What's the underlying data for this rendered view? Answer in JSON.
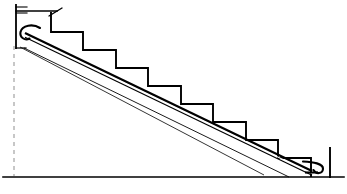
{
  "document": {
    "type": "technical-line-drawing",
    "title": "Staircase side elevation with inclined rail",
    "view": "side-elevation",
    "canvas": {
      "width": 347,
      "height": 194
    },
    "background_color": "#ffffff",
    "line_color": "#000000",
    "dashed_guide_color": "#b0b0b0"
  },
  "geometry": {
    "ground_line": {
      "label": "ground-line",
      "x1": 3,
      "y1": 177,
      "x2": 344,
      "y2": 177,
      "stroke_width": 1.6
    },
    "wall_line": {
      "label": "upper-floor-wall-edge",
      "x1": 16,
      "y1": 5,
      "x2": 16,
      "y2": 48,
      "stroke_width": 1.8
    },
    "wall_ticks": [
      {
        "label": "wall-tick-top",
        "x1": 16,
        "y1": 7,
        "x2": 27,
        "y2": 7
      },
      {
        "label": "wall-tick-lower",
        "x1": 16,
        "y1": 13,
        "x2": 27,
        "y2": 13
      }
    ],
    "top_floor_line": {
      "label": "top-landing-floor",
      "x1": 16,
      "y1": 11,
      "x2": 57,
      "y2": 11,
      "stroke_width": 1.6
    },
    "newel_marker": {
      "label": "top-newel-post-slash",
      "x1": 49,
      "y1": 16,
      "x2": 62,
      "y2": 8,
      "stroke_width": 1.4
    },
    "newel_drop": {
      "label": "top-newel-drop",
      "x1": 51,
      "y1": 13,
      "x2": 51,
      "y2": 32,
      "stroke_width": 1.8
    },
    "dashed_plumb_line": {
      "label": "plumb-reference-dashed",
      "x1": 14,
      "y1": 46,
      "x2": 14,
      "y2": 176,
      "dash": "4 4",
      "stroke_width": 1.4
    },
    "step_profile": {
      "label": "stair-nosing-profile",
      "description": "8 treads and risers descending left to right",
      "start": {
        "x": 51,
        "y": 32
      },
      "points": [
        [
          51,
          32
        ],
        [
          83,
          32
        ],
        [
          83,
          50
        ],
        [
          116,
          50
        ],
        [
          116,
          68
        ],
        [
          148,
          68
        ],
        [
          148,
          86
        ],
        [
          181,
          86
        ],
        [
          181,
          104
        ],
        [
          213,
          104
        ],
        [
          213,
          122
        ],
        [
          246,
          122
        ],
        [
          246,
          140
        ],
        [
          278,
          140
        ],
        [
          278,
          158
        ],
        [
          311,
          158
        ],
        [
          311,
          176
        ]
      ],
      "tread_depth": 32.5,
      "riser_height": 18,
      "step_count": 8,
      "stroke_width": 1.9
    },
    "bottom_post": {
      "label": "bottom-newel-post",
      "x1": 330,
      "y1": 148,
      "x2": 330,
      "y2": 177,
      "stroke_width": 1.9
    },
    "rail": {
      "label": "inclined-handrail",
      "description": "Double-line inclined rail following stair pitch, hooked at both ends",
      "upper_end": {
        "x": 25,
        "y": 34
      },
      "lower_end": {
        "x": 312,
        "y": 172
      },
      "stroke_width": 2.2,
      "secondary_stroke_width": 1.2,
      "offset": 4,
      "top_hook": {
        "label": "rail-top-hook",
        "path": "M 37 28 C 30 24, 21 28, 22 35 C 22 39, 26 41, 29 39"
      },
      "bottom_hook": {
        "label": "rail-bottom-hook",
        "path": "M 307 163 C 317 165, 324 166, 323 171 C 322 175, 316 175, 314 171"
      }
    },
    "stringer": {
      "label": "stair-stringer-underside",
      "x1": 24,
      "y1": 48,
      "x2": 289,
      "y2": 177,
      "stroke_width": 0.9
    },
    "stringer_lower": {
      "label": "stringer-lower-edge",
      "x1": 20,
      "y1": 47,
      "x2": 264,
      "y2": 175,
      "stroke_width": 0.8
    },
    "left_base_tick": {
      "label": "left-rail-base-tick",
      "x1": 16,
      "y1": 48,
      "x2": 26,
      "y2": 48,
      "stroke_width": 1.2
    }
  },
  "labels": {
    "none_visible": ""
  }
}
